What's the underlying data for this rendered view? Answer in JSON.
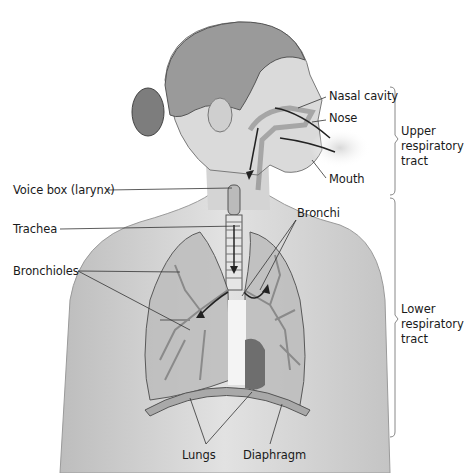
{
  "figure": {
    "colors": {
      "line": "#333333",
      "bracket": "#888888",
      "skin": "#cfcfcf",
      "lung": "#b8b8b8",
      "heart": "#6e6e6e",
      "breath": "#e3e3e3"
    }
  },
  "labels": {
    "nasal_cavity": "Nasal cavity",
    "nose": "Nose",
    "mouth": "Mouth",
    "voice_box": "Voice box (larynx)",
    "trachea": "Trachea",
    "bronchi": "Bronchi",
    "bronchioles": "Bronchioles",
    "lungs": "Lungs",
    "diaphragm": "Diaphragm"
  },
  "groups": {
    "upper": [
      "Upper",
      "respiratory",
      "tract"
    ],
    "lower": [
      "Lower",
      "respiratory",
      "tract"
    ]
  }
}
